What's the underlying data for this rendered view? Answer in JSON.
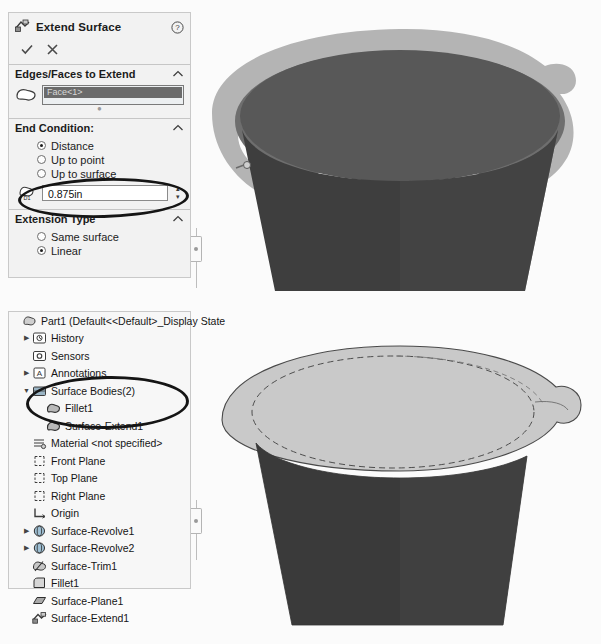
{
  "property_manager": {
    "title": "Extend Surface",
    "title_icon": "extend-surface-icon",
    "help_icon": "help-icon",
    "accept_label": "✓",
    "cancel_label": "✕",
    "sections": [
      {
        "header": "Edges/Faces to Extend",
        "collapse_icon": "chevron-up-icon",
        "selection_icon": "face-selection-icon",
        "selection_value": "Face<1>"
      },
      {
        "header": "End Condition:",
        "collapse_icon": "chevron-up-icon",
        "options": [
          {
            "label": "Distance",
            "selected": true
          },
          {
            "label": "Up to point",
            "selected": false
          },
          {
            "label": "Up to surface",
            "selected": false
          }
        ],
        "distance": {
          "icon_label": "D1",
          "value": "0.875in",
          "spin_up": "▴",
          "spin_down": "▾"
        }
      },
      {
        "header": "Extension Type",
        "collapse_icon": "chevron-up-icon",
        "options": [
          {
            "label": "Same surface",
            "selected": false
          },
          {
            "label": "Linear",
            "selected": true
          }
        ]
      }
    ]
  },
  "feature_tree": {
    "items": [
      {
        "label": "Part1  (Default<<Default>_Display State",
        "depth": 0,
        "arrow": "",
        "icon": "part-icon"
      },
      {
        "label": "History",
        "depth": 1,
        "arrow": "▶",
        "icon": "history-icon"
      },
      {
        "label": "Sensors",
        "depth": 1,
        "arrow": "",
        "icon": "sensors-icon"
      },
      {
        "label": "Annotations",
        "depth": 1,
        "arrow": "▶",
        "icon": "annotations-icon"
      },
      {
        "label": "Surface Bodies(2)",
        "depth": 1,
        "arrow": "▼",
        "icon": "surface-bodies-icon"
      },
      {
        "label": "Fillet1",
        "depth": 2,
        "arrow": "",
        "icon": "surface-body-icon"
      },
      {
        "label": "Surface-Extend1",
        "depth": 2,
        "arrow": "",
        "icon": "surface-body-icon"
      },
      {
        "label": "Material <not specified>",
        "depth": 1,
        "arrow": "",
        "icon": "material-icon"
      },
      {
        "label": "Front Plane",
        "depth": 1,
        "arrow": "",
        "icon": "plane-icon"
      },
      {
        "label": "Top Plane",
        "depth": 1,
        "arrow": "",
        "icon": "plane-icon"
      },
      {
        "label": "Right Plane",
        "depth": 1,
        "arrow": "",
        "icon": "plane-icon"
      },
      {
        "label": "Origin",
        "depth": 1,
        "arrow": "",
        "icon": "origin-icon"
      },
      {
        "label": "Surface-Revolve1",
        "depth": 1,
        "arrow": "▶",
        "icon": "surface-revolve-icon"
      },
      {
        "label": "Surface-Revolve2",
        "depth": 1,
        "arrow": "▶",
        "icon": "surface-revolve-icon"
      },
      {
        "label": "Surface-Trim1",
        "depth": 1,
        "arrow": "",
        "icon": "surface-trim-icon"
      },
      {
        "label": "Fillet1",
        "depth": 1,
        "arrow": "",
        "icon": "fillet-icon"
      },
      {
        "label": "Surface-Plane1",
        "depth": 1,
        "arrow": "",
        "icon": "surface-plane-icon"
      },
      {
        "label": "Surface-Extend1",
        "depth": 1,
        "arrow": "",
        "icon": "surface-extend-icon"
      }
    ]
  },
  "viewport_top": {
    "name": "preview-viewport",
    "colors": {
      "selected_face": "#585858",
      "extension_preview": "#b4b4b4",
      "body_wall": "#3e3e3e",
      "rim_band": "#6e6e6e",
      "background": "#fbfbfb"
    }
  },
  "viewport_bottom": {
    "name": "result-viewport",
    "colors": {
      "flange_top": "#c9c9c9",
      "body_wall": "#3a3a3a",
      "outline": "#4a4a4a",
      "background": "#fbfbfb"
    }
  },
  "annotations": [
    {
      "name": "distance-field-highlight"
    },
    {
      "name": "surface-bodies-highlight"
    }
  ]
}
